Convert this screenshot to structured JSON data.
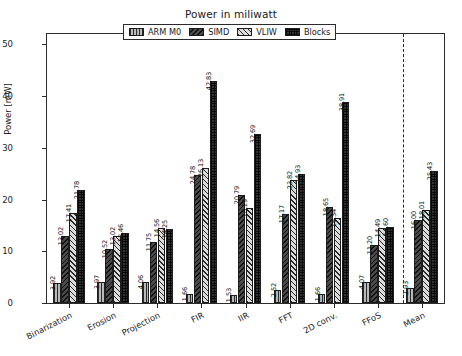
{
  "chart_data": {
    "type": "bar",
    "title": "Power in miliwatt",
    "xlabel": "",
    "ylabel": "Power [mW]",
    "ylim": [
      0,
      52
    ],
    "yticks": [
      0,
      10,
      20,
      30,
      40,
      50
    ],
    "grid": false,
    "legend_position": "upper center",
    "categories": [
      "Binarization",
      "Erosion",
      "Projection",
      "FIR",
      "IIR",
      "FFT",
      "2D conv.",
      "FFoS",
      "Mean"
    ],
    "series": [
      {
        "name": "ARM M0",
        "values": [
          3.92,
          3.97,
          4.06,
          1.66,
          1.53,
          2.52,
          1.66,
          4.07,
          2.93
        ]
      },
      {
        "name": "SIMD",
        "values": [
          13.02,
          10.52,
          11.75,
          24.78,
          20.79,
          17.17,
          18.65,
          11.2,
          16.0
        ]
      },
      {
        "name": "VLIW",
        "values": [
          17.41,
          13.02,
          14.56,
          26.13,
          18.29,
          23.82,
          16.34,
          14.49,
          18.01
        ]
      },
      {
        "name": "Blocks",
        "values": [
          21.78,
          13.46,
          14.25,
          42.83,
          32.69,
          24.93,
          38.91,
          14.6,
          25.43
        ]
      }
    ],
    "value_labels": [
      [
        "3.92",
        "13.02",
        "17.41",
        "21.78"
      ],
      [
        "3.97",
        "10.52",
        "13.02",
        "13.46"
      ],
      [
        "4.06",
        "11.75",
        "14.56",
        "14.25"
      ],
      [
        "1.66",
        "24.78",
        "26.13",
        "42.83"
      ],
      [
        "1.53",
        "20.79",
        "18.29",
        "32.69"
      ],
      [
        "2.52",
        "17.17",
        "23.82",
        "24.93"
      ],
      [
        "1.66",
        "18.65",
        "16.34",
        "38.91"
      ],
      [
        "4.07",
        "11.20",
        "14.49",
        "14.60"
      ],
      [
        "2.93",
        "16.00",
        "18.01",
        "25.43"
      ]
    ],
    "annotations": [
      "dashed vertical separator before Mean group"
    ],
    "colors": {
      "arm_m0": "#b9b9b9",
      "simd": "#4a4a4a",
      "vliw": "#dcdcdc",
      "blocks": "#333333",
      "axis": "#2b2b2b",
      "background": "#ffffff"
    }
  }
}
